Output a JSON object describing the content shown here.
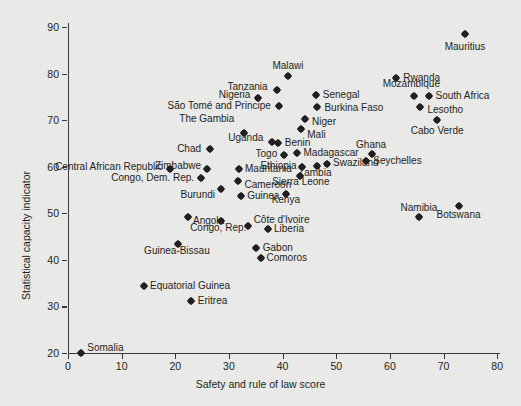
{
  "chart_data": {
    "type": "scatter",
    "title": "",
    "xlabel": "Safety and rule of law score",
    "ylabel": "Statistical capacity indicator",
    "xlim": [
      0,
      80
    ],
    "ylim": [
      20,
      90
    ],
    "xticks": [
      "0",
      "10",
      "20",
      "30",
      "40",
      "50",
      "60",
      "70",
      "80"
    ],
    "yticks": [
      "20",
      "30",
      "40",
      "50",
      "60",
      "70",
      "80",
      "90"
    ],
    "grid": false,
    "legend": "none",
    "background_color": "#e9e9e7",
    "marker_color": "#231f20",
    "points": [
      {
        "label": "Mauritius",
        "x": 74.0,
        "y": 88.6,
        "lx": 74.0,
        "ly": 85.8,
        "anchor": "c"
      },
      {
        "label": "Rwanda",
        "x": 61.2,
        "y": 79.1,
        "lx": 62.5,
        "ly": 79.1,
        "anchor": "l"
      },
      {
        "label": "Mozambique",
        "x": 64.4,
        "y": 75.2,
        "lx": 64.0,
        "ly": 77.8,
        "anchor": "c"
      },
      {
        "label": "South Africa",
        "x": 67.2,
        "y": 75.2,
        "lx": 68.5,
        "ly": 75.2,
        "anchor": "l"
      },
      {
        "label": "Lesotho",
        "x": 65.7,
        "y": 72.9,
        "lx": 67.0,
        "ly": 72.1,
        "anchor": "l"
      },
      {
        "label": "Cabo Verde",
        "x": 68.8,
        "y": 70.1,
        "lx": 68.8,
        "ly": 67.6,
        "anchor": "c"
      },
      {
        "label": "Malawi",
        "x": 41.0,
        "y": 79.5,
        "lx": 41.0,
        "ly": 81.7,
        "anchor": "c"
      },
      {
        "label": "Tanzania",
        "x": 39.0,
        "y": 76.5,
        "lx": 37.2,
        "ly": 77.2,
        "anchor": "r"
      },
      {
        "label": "Nigeria",
        "x": 35.5,
        "y": 74.7,
        "lx": 34.0,
        "ly": 75.4,
        "anchor": "r"
      },
      {
        "label": "Senegal",
        "x": 46.2,
        "y": 75.4,
        "lx": 47.5,
        "ly": 75.4,
        "anchor": "l"
      },
      {
        "label": "Burkina Faso",
        "x": 46.5,
        "y": 72.8,
        "lx": 47.8,
        "ly": 72.6,
        "anchor": "l"
      },
      {
        "label": "São Tomé and Principe",
        "x": 39.3,
        "y": 73.0,
        "lx": 37.8,
        "ly": 73.0,
        "anchor": "r"
      },
      {
        "label": "The Gambia",
        "x": 32.8,
        "y": 67.2,
        "lx": 31.0,
        "ly": 70.2,
        "anchor": "r"
      },
      {
        "label": "Niger",
        "x": 44.2,
        "y": 70.3,
        "lx": 45.5,
        "ly": 69.5,
        "anchor": "l"
      },
      {
        "label": "Mali",
        "x": 43.4,
        "y": 68.0,
        "lx": 44.6,
        "ly": 66.8,
        "anchor": "l"
      },
      {
        "label": "Uganda",
        "x": 38.0,
        "y": 65.3,
        "lx": 36.4,
        "ly": 66.1,
        "anchor": "r"
      },
      {
        "label": "Benin",
        "x": 39.2,
        "y": 65.1,
        "lx": 40.4,
        "ly": 65.2,
        "anchor": "l"
      },
      {
        "label": "Chad",
        "x": 26.4,
        "y": 63.8,
        "lx": 24.8,
        "ly": 63.8,
        "anchor": "r"
      },
      {
        "label": "Togo",
        "x": 40.3,
        "y": 62.6,
        "lx": 39.0,
        "ly": 62.8,
        "anchor": "r"
      },
      {
        "label": "Madagascar",
        "x": 42.6,
        "y": 63.0,
        "lx": 43.9,
        "ly": 63.0,
        "anchor": "l"
      },
      {
        "label": "Ghana",
        "x": 56.7,
        "y": 62.8,
        "lx": 56.5,
        "ly": 64.6,
        "anchor": "c"
      },
      {
        "label": "Seychelles",
        "x": 55.6,
        "y": 61.3,
        "lx": 56.9,
        "ly": 61.3,
        "anchor": "l"
      },
      {
        "label": "Swaziland",
        "x": 48.2,
        "y": 60.5,
        "lx": 49.4,
        "ly": 60.8,
        "anchor": "l"
      },
      {
        "label": "Zambia",
        "x": 46.5,
        "y": 60.2,
        "lx": 46.0,
        "ly": 58.7,
        "anchor": "c"
      },
      {
        "label": "Ethiopia",
        "x": 43.6,
        "y": 60.0,
        "lx": 42.6,
        "ly": 60.2,
        "anchor": "r"
      },
      {
        "label": "Sierra Leone",
        "x": 43.2,
        "y": 58.0,
        "lx": 43.4,
        "ly": 56.8,
        "anchor": "c"
      },
      {
        "label": "Kenya",
        "x": 40.6,
        "y": 54.2,
        "lx": 40.6,
        "ly": 52.8,
        "anchor": "c"
      },
      {
        "label": "Central African Republic",
        "x": 19.0,
        "y": 59.6,
        "lx": 17.6,
        "ly": 60.0,
        "anchor": "r"
      },
      {
        "label": "Zimbabwe",
        "x": 26.0,
        "y": 59.5,
        "lx": 24.8,
        "ly": 60.2,
        "anchor": "r"
      },
      {
        "label": "Mauritania",
        "x": 31.8,
        "y": 59.5,
        "lx": 33.0,
        "ly": 59.5,
        "anchor": "l"
      },
      {
        "label": "Congo, Dem. Rep.",
        "x": 24.8,
        "y": 57.6,
        "lx": 23.5,
        "ly": 57.5,
        "anchor": "r"
      },
      {
        "label": "Cameroon",
        "x": 31.6,
        "y": 57.0,
        "lx": 32.9,
        "ly": 56.0,
        "anchor": "l"
      },
      {
        "label": "Burundi",
        "x": 28.6,
        "y": 55.2,
        "lx": 27.4,
        "ly": 54.0,
        "anchor": "r"
      },
      {
        "label": "Guinea",
        "x": 32.2,
        "y": 53.8,
        "lx": 33.4,
        "ly": 53.8,
        "anchor": "l"
      },
      {
        "label": "Angola",
        "x": 22.3,
        "y": 49.1,
        "lx": 23.3,
        "ly": 48.4,
        "anchor": "l"
      },
      {
        "label": "Congo, Rep.",
        "x": 28.5,
        "y": 48.3,
        "lx": 28.0,
        "ly": 46.8,
        "anchor": "c"
      },
      {
        "label": "Côte d'Ivoire",
        "x": 33.6,
        "y": 47.3,
        "lx": 34.6,
        "ly": 48.6,
        "anchor": "l"
      },
      {
        "label": "Liberia",
        "x": 37.2,
        "y": 46.6,
        "lx": 38.4,
        "ly": 46.6,
        "anchor": "l"
      },
      {
        "label": "Guinea-Bissau",
        "x": 20.5,
        "y": 43.5,
        "lx": 20.3,
        "ly": 41.8,
        "anchor": "c"
      },
      {
        "label": "Gabon",
        "x": 35.1,
        "y": 42.6,
        "lx": 36.3,
        "ly": 42.6,
        "anchor": "l"
      },
      {
        "label": "Comoros",
        "x": 35.9,
        "y": 40.3,
        "lx": 37.0,
        "ly": 40.3,
        "anchor": "l"
      },
      {
        "label": "Equatorial Guinea",
        "x": 14.1,
        "y": 34.4,
        "lx": 15.3,
        "ly": 34.4,
        "anchor": "l"
      },
      {
        "label": "Eritrea",
        "x": 23.0,
        "y": 31.2,
        "lx": 24.2,
        "ly": 31.2,
        "anchor": "l"
      },
      {
        "label": "Somalia",
        "x": 2.5,
        "y": 20.0,
        "lx": 3.6,
        "ly": 21.0,
        "anchor": "l"
      },
      {
        "label": "Namibia",
        "x": 65.4,
        "y": 49.3,
        "lx": 65.4,
        "ly": 51.1,
        "anchor": "c"
      },
      {
        "label": "Botswana",
        "x": 72.8,
        "y": 51.5,
        "lx": 72.8,
        "ly": 49.6,
        "anchor": "c"
      }
    ]
  }
}
